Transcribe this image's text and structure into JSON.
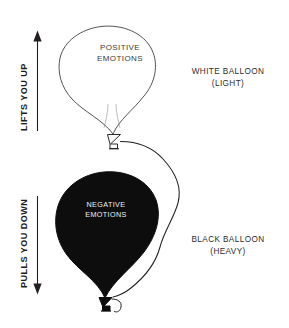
{
  "diagram": {
    "background_color": "#ffffff",
    "ink_color": "#231f20",
    "axes": [
      {
        "id": "lifts-you-up",
        "caption": "LIFTS YOU UP",
        "direction": "up",
        "icon": "arrow-up-icon"
      },
      {
        "id": "pulls-you-down",
        "caption": "PULLS YOU DOWN",
        "direction": "down",
        "icon": "arrow-down-icon"
      }
    ],
    "balloons": [
      {
        "id": "white-balloon",
        "fill": "#ffffff",
        "stroke": "#231f20",
        "inner_line1": "POSITIVE",
        "inner_line2": "EMOTIONS",
        "inner_text_color": "#3b3b3b",
        "caption_line1": "WHITE BALLOON",
        "caption_line2": "(LIGHT)"
      },
      {
        "id": "black-balloon",
        "fill": "#0d0d0d",
        "stroke": "#0d0d0d",
        "inner_line1": "NEGATIVE",
        "inner_line2": "EMOTIONS",
        "inner_text_color": "#f2f2f2",
        "caption_line1": "BLACK BALLOON",
        "caption_line2": "(HEAVY)"
      }
    ]
  }
}
